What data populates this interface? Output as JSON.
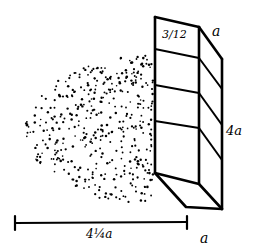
{
  "diagram": {
    "labels": {
      "top_section": "3/12",
      "top_depth": "a",
      "height": "4a",
      "bottom_depth": "a",
      "shadow_length": "4¼a"
    },
    "colors": {
      "ink": "#000000",
      "background": "#ffffff"
    },
    "box": {
      "sections": 4
    },
    "shadow": {
      "style": "stippled-oval"
    }
  }
}
